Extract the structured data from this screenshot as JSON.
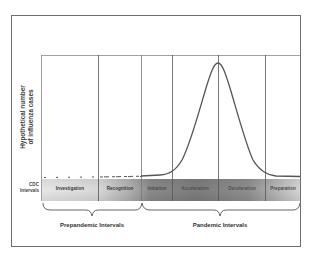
{
  "figure": {
    "y_axis_label_line1": "Hypothetical number",
    "y_axis_label_line2": "of influenza cases",
    "band_label_line1": "CDC",
    "band_label_line2": "Intervals",
    "intervals": [
      {
        "label": "Investigation",
        "color": "#3a3a3a"
      },
      {
        "label": "Recognition",
        "color": "#3a3a3a"
      },
      {
        "label": "Initiation",
        "color": "#5a5a5a"
      },
      {
        "label": "Acceleration",
        "color": "#666666"
      },
      {
        "label": "Deceleration",
        "color": "#666666"
      },
      {
        "label": "Preparation",
        "color": "#5a5a5a"
      }
    ],
    "groups": [
      {
        "label": "Prepandemic Intervals"
      },
      {
        "label": "Pandemic Intervals"
      }
    ],
    "colors": {
      "frame": "#6e6e6e",
      "curve": "#555555",
      "band_light": "#e2e2e2",
      "band_dark": "#7a7a7a"
    }
  }
}
